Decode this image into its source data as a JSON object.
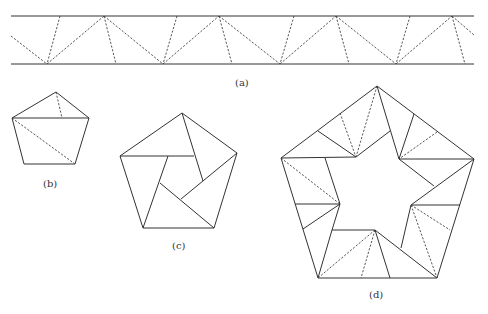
{
  "figure": {
    "labels": {
      "a": "(a)",
      "b": "(b)",
      "c": "(c)",
      "d": "(d)"
    },
    "strip_a": {
      "description": "Paper strip with dashed fold lines forming triangles",
      "top_y": 16,
      "bottom_y": 64,
      "x_start": 11,
      "x_end": 474
    },
    "pentagon_b": {
      "description": "Knotted pentagon with fold lines"
    },
    "pentagon_c": {
      "description": "Pentagon divided into pinwheel of quadrilaterals around an inner pentagon"
    },
    "pentagon_d": {
      "description": "Large pentagon with star-shaped hole, folded strip segments with dashed creases"
    },
    "colors": {
      "line": "#333333",
      "background": "#ffffff"
    }
  }
}
